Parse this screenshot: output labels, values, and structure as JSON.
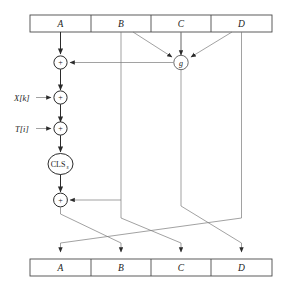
{
  "figure": {
    "caption": ""
  },
  "top_register": {
    "name": "input-register",
    "cells": [
      {
        "label": "A"
      },
      {
        "label": "B"
      },
      {
        "label": "C"
      },
      {
        "label": "D"
      }
    ]
  },
  "bottom_register": {
    "name": "output-register",
    "cells": [
      {
        "label": "A"
      },
      {
        "label": "B"
      },
      {
        "label": "C"
      },
      {
        "label": "D"
      }
    ]
  },
  "nodes": {
    "adder_1": {
      "label": "+",
      "name": "adder-g"
    },
    "adder_2": {
      "label": "+",
      "name": "adder-xk"
    },
    "adder_3": {
      "label": "+",
      "name": "adder-ti"
    },
    "adder_4": {
      "label": "+",
      "name": "adder-b"
    },
    "g_function": {
      "label": "g",
      "name": "g-function"
    },
    "cls": {
      "label": "CLS",
      "subscript": "s",
      "name": "circular-left-shift"
    }
  },
  "inputs": [
    {
      "label": "X[k]",
      "name": "input-xk"
    },
    {
      "label": "T[i]",
      "name": "input-ti"
    }
  ],
  "colors": {
    "wire": "#7a7a7a",
    "wire_dark": "#2b2b2b",
    "box_stroke": "#4a4a4a",
    "background": "#ffffff",
    "text": "#1a1a1a"
  }
}
